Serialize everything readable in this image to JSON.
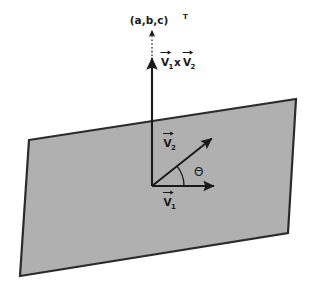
{
  "figure": {
    "title_semantic": "cross-product-of-two-vectors-in-a-plane",
    "background_color": "#ffffff"
  },
  "plane": {
    "name": "shaded-plane",
    "fill_color": "#b0b0b0",
    "stroke_color": "#2b2b2b",
    "corners": [
      [
        29,
        140
      ],
      [
        296,
        99
      ],
      [
        288,
        233
      ],
      [
        20,
        276
      ]
    ]
  },
  "labels": {
    "normal_vector": {
      "base": "(a,b,c)",
      "superscript": "T"
    },
    "cross_product": {
      "first": "V",
      "first_sub": "1",
      "operator": "x",
      "second": "V",
      "second_sub": "2"
    },
    "vector1": {
      "base": "V",
      "sub": "1"
    },
    "vector2": {
      "base": "V",
      "sub": "2"
    },
    "angle": "Θ"
  },
  "geometry": {
    "origin": [
      152,
      186
    ],
    "vector1_tip": [
      218,
      186
    ],
    "vector2_tip": [
      215,
      136
    ],
    "normal_solid_tip": [
      152,
      60
    ],
    "normal_dotted_tip": [
      152,
      32
    ],
    "angle_arc_radius": 32
  },
  "colors": {
    "ink": "#1a1a1a",
    "plane_fill": "#b0b0b0",
    "plane_stroke": "#2b2b2b"
  }
}
